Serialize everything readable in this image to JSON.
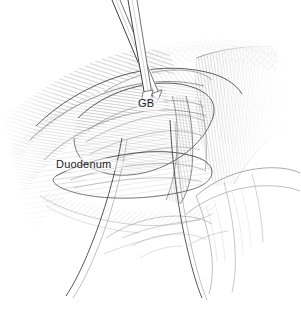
{
  "figure": {
    "kind": "surgical-line-art-illustration",
    "background_color": "#ffffff",
    "ink_color": "#2b2b2b",
    "width": 301,
    "height": 310,
    "labels": [
      {
        "id": "gb",
        "text": "GB",
        "x": 138,
        "y": 98,
        "target": "gallbladder"
      },
      {
        "id": "duo",
        "text": "Duodenum",
        "x": 56,
        "y": 159,
        "target": "duodenum"
      }
    ],
    "elements": [
      {
        "name": "retractor-shaft-left",
        "type": "instrument"
      },
      {
        "name": "retractor-shaft-right",
        "type": "instrument"
      },
      {
        "name": "liver-edge-crosshatch",
        "type": "tissue"
      },
      {
        "name": "gallbladder-body",
        "type": "tissue"
      },
      {
        "name": "duodenum-body",
        "type": "tissue"
      },
      {
        "name": "hepatoduodenal-ligament",
        "type": "tissue"
      },
      {
        "name": "omentum-fold",
        "type": "tissue"
      },
      {
        "name": "suture-thread-left",
        "type": "suture"
      },
      {
        "name": "suture-thread-right",
        "type": "suture"
      }
    ]
  }
}
